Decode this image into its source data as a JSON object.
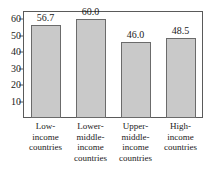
{
  "chart_data": {
    "type": "bar",
    "title": "",
    "title_note": "partially cropped title sliver at top edge, illegible",
    "xlabel": "",
    "ylabel": "",
    "categories": [
      "Low-income countries",
      "Lower-middle-income countries",
      "Upper-middle-income countries",
      "High-income countries"
    ],
    "category_lines": [
      [
        "Low-",
        "income",
        "countries"
      ],
      [
        "Lower-",
        "middle-",
        "income",
        "countries"
      ],
      [
        "Upper-",
        "middle-",
        "income",
        "countries"
      ],
      [
        "High-",
        "income",
        "countries"
      ]
    ],
    "values": [
      56.7,
      60.0,
      46.0,
      48.5
    ],
    "value_labels": [
      "56.7",
      "60.0",
      "46.0",
      "48.5"
    ],
    "ylim": [
      0,
      65
    ],
    "yticks": [
      10,
      20,
      30,
      40,
      50,
      60
    ],
    "ytick_labels": [
      "10",
      "20",
      "30",
      "40",
      "50",
      "60"
    ],
    "grid": false,
    "legend": false,
    "bar_fill_color": "#c9c9c9",
    "bar_border_color": "#6b6b6b",
    "axis_color": "#5a5a5a",
    "text_color": "#1a1a1a"
  }
}
